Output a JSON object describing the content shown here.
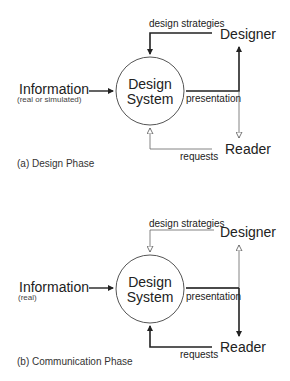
{
  "diagrams": [
    {
      "caption": "(a) Design Phase",
      "input_label": "Information",
      "input_sublabel": "(real or simulated)",
      "center_line1": "Design",
      "center_line2": "System",
      "designer_label": "Designer",
      "reader_label": "Reader",
      "edge_strategies": "design strategies",
      "edge_presentation": "presentation",
      "edge_requests": "requests",
      "emphasis": "designer loop (bold), reader loop (thin, hollow arrows)"
    },
    {
      "caption": "(b) Communication Phase",
      "input_label": "Information",
      "input_sublabel": "(real)",
      "center_line1": "Design",
      "center_line2": "System",
      "designer_label": "Designer",
      "reader_label": "Reader",
      "edge_strategies": "design strategies",
      "edge_presentation": "presentation",
      "edge_requests": "requests",
      "emphasis": "reader loop (bold), designer loop (thin, hollow arrows)"
    }
  ],
  "colors": {
    "stroke": "#222222",
    "thin_stroke": "#666666",
    "background": "#ffffff"
  }
}
